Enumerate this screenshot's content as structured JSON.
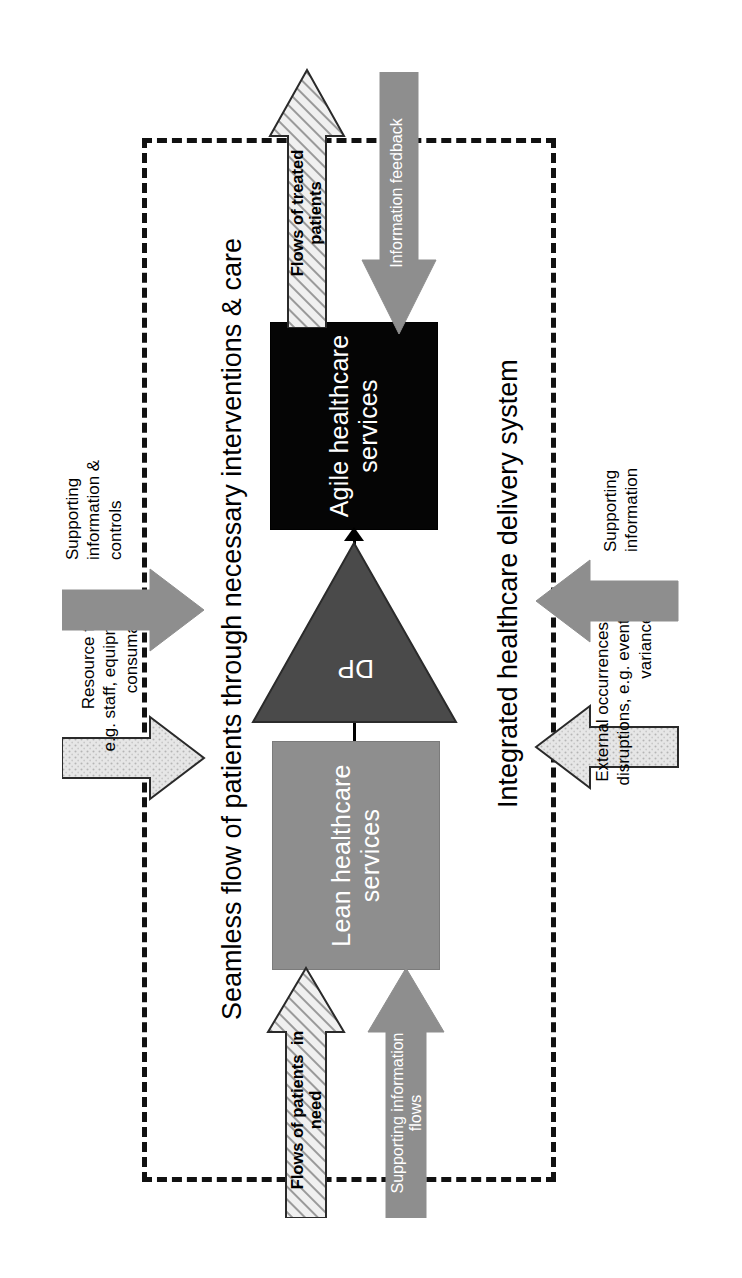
{
  "figure": {
    "type": "process-flow-diagram",
    "orientation": "rotated-90-ccw",
    "boundary_label": "Integrated healthcare delivery system",
    "flow_label": "Seamless flow of patients through necessary interventions & care"
  },
  "nodes": {
    "lean": {
      "label": "Lean healthcare\nservices",
      "fill": "#8e8e8e",
      "text_color": "#ffffff"
    },
    "agile": {
      "label": "Agile healthcare\nservices",
      "fill": "#050505",
      "text_color": "#ffffff"
    },
    "dp": {
      "label": "DP",
      "fill": "#4a4a4a",
      "text_color": "#ffffff"
    }
  },
  "arrows": {
    "patients_in": {
      "label": "Flows of patients  in\nneed",
      "style": "hatched",
      "text_color": "#000000"
    },
    "supporting_info_flows": {
      "label": "Supporting information\nflows",
      "style": "solid-gray",
      "text_color": "#ffffff"
    },
    "treated_patients": {
      "label": "Flows of treated\npatients",
      "style": "hatched",
      "text_color": "#000000"
    },
    "information_feedback": {
      "label": "Information feedback",
      "style": "solid-gray",
      "text_color": "#ffffff"
    },
    "resource_flows": {
      "label": "Resource flows\ne.g. staff, equipment,\nconsumables",
      "style": "light-speckled"
    },
    "supporting_info_controls": {
      "label": "Supporting\ninformation &\ncontrols",
      "style": "solid-gray"
    },
    "external_occurrences": {
      "label": "External occurrences &\ndisruptions, e.g. events,\nvariances",
      "style": "light-speckled"
    },
    "supporting_information": {
      "label": "Supporting\ninformation",
      "style": "solid-gray"
    }
  },
  "colors": {
    "boundary": "#111111",
    "gray_mid": "#8e8e8e",
    "gray_dark": "#4a4a4a",
    "gray_light": "#d9d9d9",
    "black": "#050505",
    "white": "#ffffff"
  }
}
